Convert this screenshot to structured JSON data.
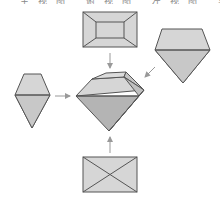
{
  "caption": {
    "text": "主视图 俯视图 左视图 实物图",
    "note": "cut-off text row at top edge; only lower strokes visible"
  },
  "colors": {
    "background": "#ffffff",
    "outline": "#555555",
    "fill_light": "#d6d6d6",
    "fill_mid": "#c4c4c4",
    "fill_dark": "#b2b2b2",
    "arrow": "#999999"
  },
  "diagram": {
    "nodes": [
      {
        "id": "top-view",
        "shape": "rectangle-with-inner-rectangle",
        "position": "top"
      },
      {
        "id": "front-view",
        "shape": "pentagon-diamond",
        "position": "right"
      },
      {
        "id": "side-view",
        "shape": "hexagonal-kite",
        "position": "left"
      },
      {
        "id": "bottom-view",
        "shape": "rectangle-with-diagonals",
        "position": "bottom"
      },
      {
        "id": "gem-3d",
        "shape": "faceted-gem",
        "position": "center"
      }
    ],
    "arrows": [
      {
        "from": "top-view",
        "to": "gem-3d"
      },
      {
        "from": "front-view",
        "to": "gem-3d"
      },
      {
        "from": "side-view",
        "to": "gem-3d"
      },
      {
        "from": "bottom-view",
        "to": "gem-3d"
      }
    ]
  }
}
